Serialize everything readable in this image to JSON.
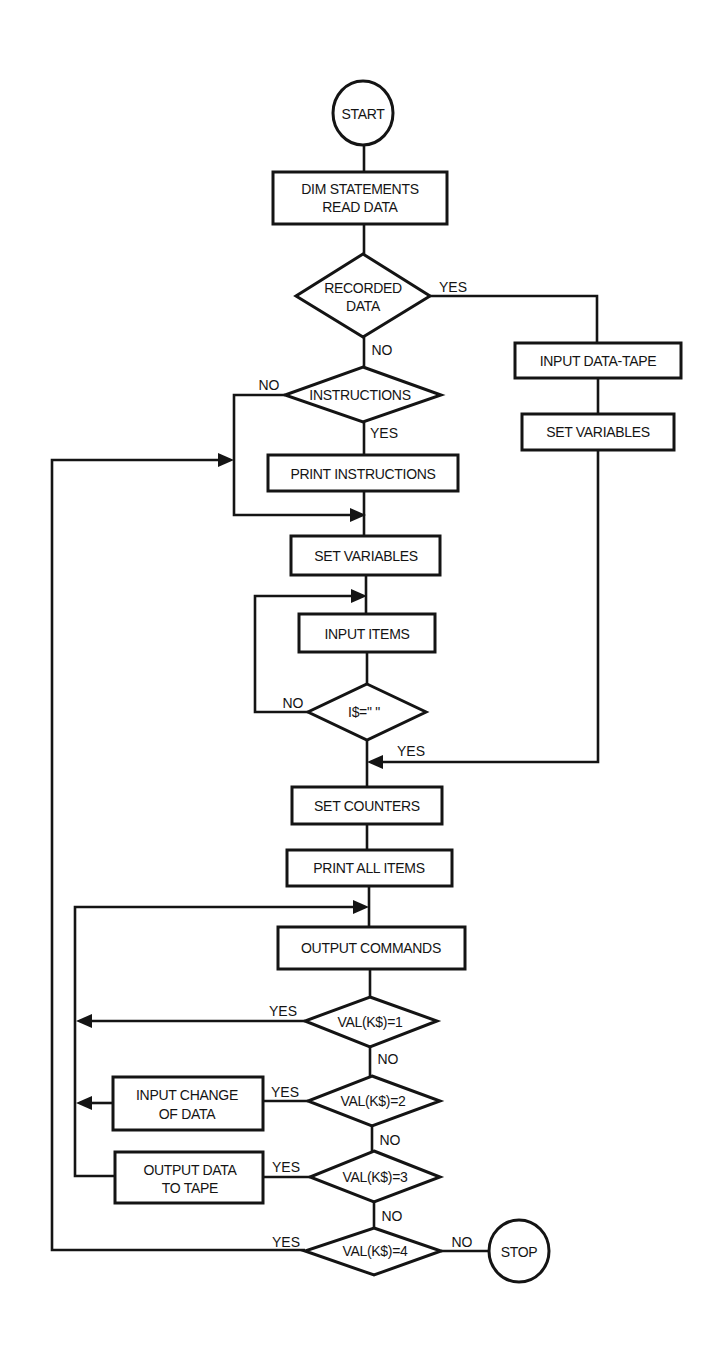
{
  "diagram": {
    "type": "flowchart",
    "colors": {
      "ink": "#141414",
      "background": "#ffffff"
    },
    "nodes": {
      "start": {
        "shape": "circle",
        "label": "START"
      },
      "dim": {
        "shape": "rect",
        "line1": "DIM STATEMENTS",
        "line2": "READ DATA"
      },
      "recorded": {
        "shape": "diamond",
        "line1": "RECORDED",
        "line2": "DATA"
      },
      "instructions": {
        "shape": "diamond",
        "label": "INSTRUCTIONS"
      },
      "print_instructions": {
        "shape": "rect",
        "label": "PRINT INSTRUCTIONS"
      },
      "input_tape": {
        "shape": "rect",
        "label": "INPUT DATA-TAPE"
      },
      "set_vars_right": {
        "shape": "rect",
        "label": "SET VARIABLES"
      },
      "set_vars_main": {
        "shape": "rect",
        "label": "SET VARIABLES"
      },
      "input_items": {
        "shape": "rect",
        "label": "INPUT ITEMS"
      },
      "i_empty": {
        "shape": "diamond",
        "label": "I$=\" \""
      },
      "set_counters": {
        "shape": "rect",
        "label": "SET COUNTERS"
      },
      "print_all": {
        "shape": "rect",
        "label": "PRINT ALL ITEMS"
      },
      "output_commands": {
        "shape": "rect",
        "label": "OUTPUT COMMANDS"
      },
      "val1": {
        "shape": "diamond",
        "label": "VAL(K$)=1"
      },
      "val2": {
        "shape": "diamond",
        "label": "VAL(K$)=2"
      },
      "val3": {
        "shape": "diamond",
        "label": "VAL(K$)=3"
      },
      "val4": {
        "shape": "diamond",
        "label": "VAL(K$)=4"
      },
      "input_change": {
        "shape": "rect",
        "line1": "INPUT CHANGE",
        "line2": "OF DATA"
      },
      "output_tape": {
        "shape": "rect",
        "line1": "OUTPUT DATA",
        "line2": "TO TAPE"
      },
      "stop": {
        "shape": "circle",
        "label": "STOP"
      }
    },
    "edges": {
      "recorded_yes": "YES",
      "recorded_no": "NO",
      "instructions_no": "NO",
      "instructions_yes": "YES",
      "i_empty_no": "NO",
      "i_empty_yes": "YES",
      "val1_yes": "YES",
      "val1_no": "NO",
      "val2_yes": "YES",
      "val2_no": "NO",
      "val3_yes": "YES",
      "val3_no": "NO",
      "val4_yes": "YES",
      "val4_no": "NO"
    }
  }
}
